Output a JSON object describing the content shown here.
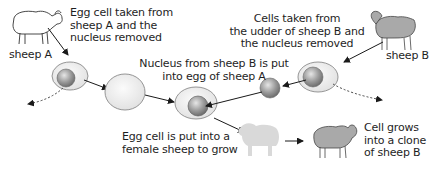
{
  "diagram": {
    "type": "process-flow",
    "labels": {
      "sheep_a": "sheep A",
      "sheep_b": "sheep B",
      "egg_taken": "Egg cell taken from\nsheep A and the\nnucleus removed",
      "cells_taken": "Cells taken from\nthe udder of sheep B and\nthe nucleus removed",
      "nucleus_put": "Nucleus from sheep B is put\ninto egg of sheep A",
      "egg_put": "Egg cell is put into a\nfemale sheep to grow",
      "clone": "Cell grows\ninto a clone\nof sheep B"
    },
    "colors": {
      "cell_fill": "#ececec",
      "cell_stroke": "#8a8a8a",
      "nucleus_fill": "#9a9a9a",
      "sheep_b_fill": "#a9a9a9",
      "surrogate_fill": "#d9d9d9",
      "arrow": "#1a1a1a"
    }
  }
}
